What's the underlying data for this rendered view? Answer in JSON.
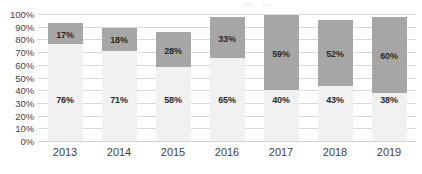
{
  "chart_data": {
    "type": "bar",
    "subtype": "stacked-column",
    "title": "",
    "xlabel": "",
    "ylabel": "",
    "ylim": [
      0,
      100
    ],
    "y_unit": "%",
    "grid": true,
    "legend_position": "top-right-cropped",
    "categories": [
      "2013",
      "2014",
      "2015",
      "2016",
      "2017",
      "2018",
      "2019"
    ],
    "y_ticks": [
      "0%",
      "10%",
      "20%",
      "30%",
      "40%",
      "50%",
      "60%",
      "70%",
      "80%",
      "90%",
      "100%"
    ],
    "y_tick_values": [
      0,
      10,
      20,
      30,
      40,
      50,
      60,
      70,
      80,
      90,
      100
    ],
    "series": [
      {
        "name": "lower-segment",
        "color": "#f1f1f1",
        "values": [
          76,
          71,
          58,
          65,
          40,
          43,
          38
        ],
        "labels": [
          "76%",
          "71%",
          "58%",
          "65%",
          "40%",
          "43%",
          "38%"
        ]
      },
      {
        "name": "upper-segment",
        "color": "#a6a6a6",
        "values": [
          17,
          18,
          28,
          33,
          59,
          52,
          60
        ],
        "labels": [
          "17%",
          "18%",
          "28%",
          "33%",
          "59%",
          "52%",
          "60%"
        ]
      }
    ],
    "totals": [
      93,
      89,
      86,
      98,
      99,
      95,
      98
    ]
  },
  "legend": {
    "cropped_text": ""
  },
  "colors": {
    "segment_low": "#f1f1f1",
    "segment_high": "#a6a6a6",
    "gridline": "#d9d9d9",
    "axis_text": "#3f3f3f",
    "label_text": "#2b2b2b",
    "background": "#ffffff"
  }
}
